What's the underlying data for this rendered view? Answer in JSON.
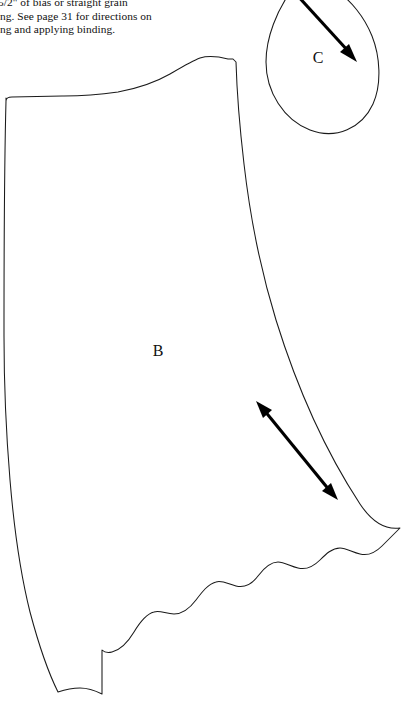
{
  "page": {
    "width": 407,
    "height": 723,
    "background_color": "#ffffff",
    "ink_color": "#1a1a1a",
    "document_type": "sewing pattern sheet"
  },
  "instructions": {
    "line_1": "e 5/2\" of bias or straight grain",
    "line_2": "ding. See page 31 for directions on",
    "line_3": "king and applying binding."
  },
  "pieces": [
    {
      "id": "piece-b",
      "label": "B",
      "label_x": 158,
      "label_y": 356,
      "description": "large skirt panel with scalloped lower edge",
      "grainline": {
        "name": "grainline-arrow-b",
        "from_x": 258,
        "from_y": 403,
        "to_x": 336,
        "to_y": 499,
        "double_headed": true
      }
    },
    {
      "id": "piece-c",
      "label": "C",
      "label_x": 318,
      "label_y": 63,
      "description": "teardrop shaped piece, clipped at top edge of page",
      "grainline": {
        "name": "grainline-arrow-c",
        "from_x": 297,
        "from_y": 0,
        "to_x": 354,
        "to_y": 60,
        "double_headed": false
      }
    }
  ]
}
